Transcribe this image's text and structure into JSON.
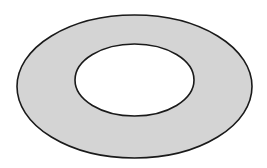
{
  "diagram": {
    "type": "annulus",
    "outer": {
      "cx": 134.5,
      "cy": 86.5,
      "rx": 117.5,
      "ry": 71.5,
      "fill": "#d4d4d4",
      "stroke": "#1a1a1a"
    },
    "inner": {
      "cx": 134.5,
      "cy": 80,
      "rx": 59.5,
      "ry": 36,
      "fill": "#ffffff",
      "stroke": "#1a1a1a"
    }
  }
}
